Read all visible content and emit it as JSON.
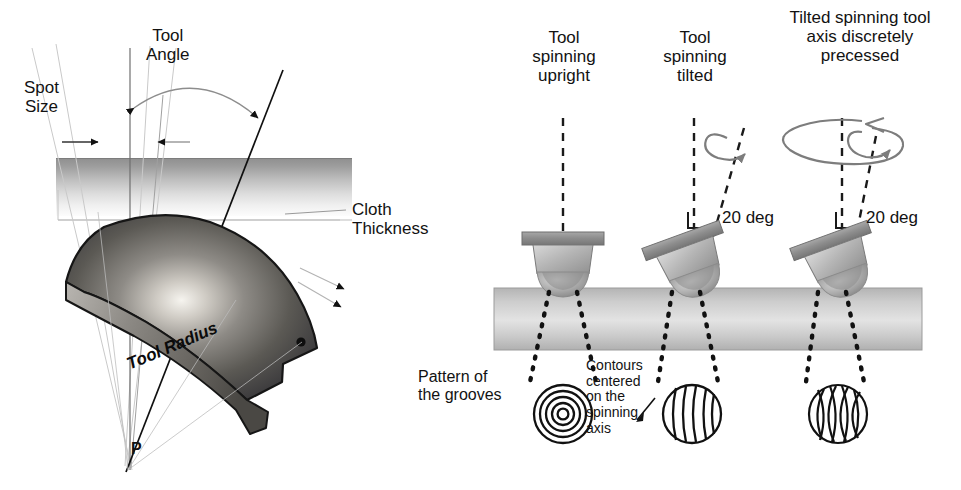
{
  "figure": {
    "title_present": false,
    "background_color": "#ffffff",
    "ink_color": "#121212",
    "gray_tool_color": "#9a9a9a",
    "gray_arrow_color": "#7d7d7d"
  },
  "left_diagram": {
    "name": "tool-contact-geometry",
    "labels": {
      "tool_angle": "Tool\nAngle",
      "spot_size": "Spot\nSize",
      "cloth_thickness": "Cloth\nThickness",
      "tool_radius": "Tool Radius",
      "pivot_point": "P"
    }
  },
  "right_diagram": {
    "name": "spinning-tool-configurations",
    "columns": [
      {
        "id": "upright",
        "heading": "Tool\nspinning\nupright",
        "angle_label": null,
        "pattern_name": "concentric-rings-pattern"
      },
      {
        "id": "tilted",
        "heading": "Tool\nspinning\ntilted",
        "angle_label": "20 deg",
        "pattern_name": "parallel-arcs-pattern"
      },
      {
        "id": "precessed",
        "heading": "Tilted spinning tool\naxis discretely\nprecessed",
        "angle_label": "20 deg",
        "pattern_name": "crosshatch-pattern"
      }
    ],
    "pattern_caption": "Pattern of\nthe grooves",
    "contours_note": "Contours\ncentered\non the\nspinning\naxis"
  }
}
